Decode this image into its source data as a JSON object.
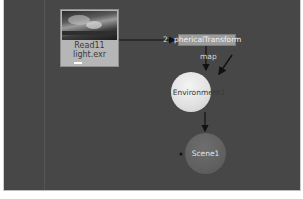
{
  "graph": {
    "background": "#474747",
    "nodes": {
      "read": {
        "name": "Read11",
        "file": "light.exr"
      },
      "spherical_transform": {
        "label": "phericalTransform"
      },
      "environment": {
        "label": "Environment1"
      },
      "scene": {
        "label": "Scene1"
      }
    },
    "edges": {
      "read_to_spherical_input": "2",
      "spherical_to_environment_input": "map"
    }
  }
}
